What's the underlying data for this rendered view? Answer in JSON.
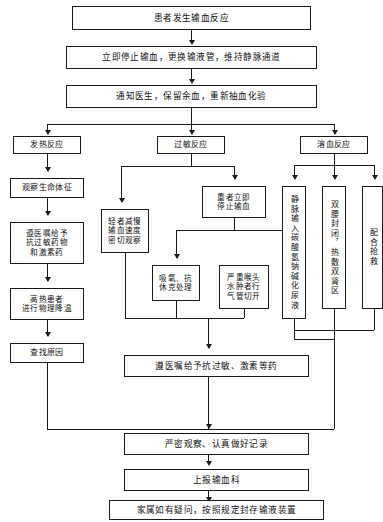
{
  "diagram": {
    "type": "flowchart",
    "language": "zh-CN",
    "line_color": "#1a1a1a",
    "background_color": "#ffffff"
  },
  "nodes": {
    "start": "患者发生输血反应",
    "step2": "立即停止输血，更换输液管，维持静脉通道",
    "step3": "通知医生，保留余血，重新抽血化验",
    "branch_fever": "发热反应",
    "branch_allergy": "过敏反应",
    "branch_hemolysis": "溶血反应",
    "fever_1": "观察生命体征",
    "fever_2_line1": "遵医嘱给予",
    "fever_2_line2": "抗过敏药物",
    "fever_2_line3": "和激素药",
    "fever_3_line1": "高热患者",
    "fever_3_line2": "进行物理降温",
    "fever_4": "查找原因",
    "allergy_mild_line1": "轻者减慢",
    "allergy_mild_line2": "输血速度",
    "allergy_mild_line3": "密切观察",
    "allergy_severe_line1": "重者立即",
    "allergy_severe_line2": "停止输血",
    "allergy_oxygen_line1": "吸氧、抗",
    "allergy_oxygen_line2": "休克处理",
    "allergy_trach_line1": "严重喉头",
    "allergy_trach_line2": "水肿者行",
    "allergy_trach_line3": "气管切开",
    "hemo_1": "静脉输入碳酸氢钠碱化尿液",
    "hemo_2": "双腰封闭，热敷双肾区",
    "hemo_3": "配合抢救",
    "merge_drug": "遵医嘱给予抗过敏、激素等药",
    "record": "严密观察、认真做好记录",
    "report": "上报输血科",
    "final": "家属如有疑问，按照规定封存输液装置"
  }
}
